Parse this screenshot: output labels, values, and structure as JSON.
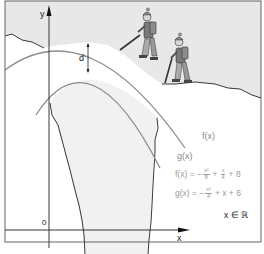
{
  "diagram": {
    "axes": {
      "x_label": "x",
      "y_label": "y",
      "origin_label": "0"
    },
    "distance_label": "d",
    "curves": [
      {
        "name": "f",
        "label": "f(x)",
        "color": "#8c8c8c"
      },
      {
        "name": "g",
        "label": "g(x)",
        "color": "#8c8c8c"
      }
    ],
    "formulas": {
      "f": {
        "lhs": "f(x) = −",
        "term1_num": "x²",
        "term1_den": "8",
        "plus1": "+",
        "term2_num": "x",
        "term2_den": "4",
        "tail": "+ 8"
      },
      "g": {
        "lhs": "g(x) = −",
        "term1_num": "x²",
        "term1_den": "4",
        "tail": "+ x + 6"
      },
      "domain": "x ∈ ℝ"
    },
    "illustration": {
      "subjects": [
        "climber-1",
        "climber-2"
      ],
      "sky_color": "#e8e8e8",
      "rock_fill": "#f1f1f1",
      "snow_fill": "#ffffff",
      "outline_color": "#222222",
      "curve_color": "#8c8c8c"
    }
  }
}
